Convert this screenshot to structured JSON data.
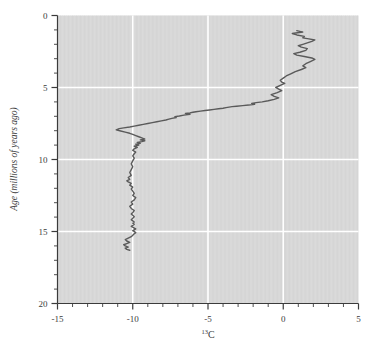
{
  "chart_data": {
    "type": "line",
    "title": "",
    "xlabel": "13C",
    "xlabel_sup": "13",
    "xlabel_base": "C",
    "ylabel": "Age (millions of years ago)",
    "xlim": [
      -15,
      5
    ],
    "ylim": [
      20,
      0
    ],
    "y_inverted": true,
    "grid": true,
    "grid_color": "#ffffff",
    "plot_bg": "#d8d8d8",
    "line_color": "#5a5a5a",
    "line_width": 1.4,
    "legend": null,
    "xticks": [
      -15,
      -10,
      -5,
      0,
      5
    ],
    "xticklabels": [
      "-15",
      "-10",
      "-5",
      "0",
      "5"
    ],
    "xminor_step": 1,
    "yticks": [
      0,
      5,
      10,
      15,
      20
    ],
    "yticklabels": [
      "0",
      "5",
      "10",
      "15",
      "20"
    ],
    "yminor_step": 1,
    "series": [
      {
        "name": "d13C record",
        "x": [
          0.9,
          1.3,
          0.6,
          0.9,
          1.4,
          1.3,
          1.7,
          2.1,
          1.9,
          1.6,
          1.3,
          1.0,
          1.2,
          1.6,
          1.5,
          1.1,
          0.7,
          0.9,
          1.4,
          1.9,
          2.1,
          1.8,
          1.5,
          1.3,
          1.5,
          1.2,
          0.8,
          0.5,
          0.2,
          0.0,
          -0.2,
          -0.1,
          0.1,
          -0.2,
          -0.5,
          -0.3,
          -0.1,
          -0.4,
          -0.8,
          -0.6,
          -0.3,
          -0.6,
          -1.0,
          -1.4,
          -1.8,
          -2.1,
          -1.9,
          -2.3,
          -2.7,
          -3.1,
          -3.4,
          -3.6,
          -3.8,
          -4.0,
          -4.3,
          -4.6,
          -4.9,
          -5.2,
          -5.5,
          -5.8,
          -6.0,
          -6.2,
          -6.5,
          -6.2,
          -6.6,
          -6.9,
          -7.2,
          -7.1,
          -7.4,
          -7.6,
          -7.8,
          -8.1,
          -8.4,
          -8.7,
          -9.0,
          -9.3,
          -9.6,
          -9.9,
          -10.2,
          -10.6,
          -10.9,
          -11.1,
          -10.8,
          -10.5,
          -10.2,
          -10.0,
          -9.8,
          -9.6,
          -9.4,
          -9.2,
          -9.5,
          -9.2,
          -9.4,
          -9.7,
          -9.5,
          -9.8,
          -9.6,
          -9.9,
          -9.7,
          -9.9,
          -10.0,
          -9.8,
          -9.9,
          -10.0,
          -9.9,
          -10.0,
          -10.1,
          -10.0,
          -10.1,
          -10.2,
          -10.1,
          -10.3,
          -10.2,
          -10.4,
          -10.3,
          -10.1,
          -10.2,
          -10.0,
          -10.1,
          -10.0,
          -9.9,
          -10.0,
          -9.8,
          -9.9,
          -10.1,
          -10.0,
          -10.2,
          -10.1,
          -9.9,
          -10.0,
          -10.1,
          -10.0,
          -9.9,
          -10.0,
          -10.1,
          -10.0,
          -9.9,
          -10.0,
          -9.9,
          -10.0,
          -10.1,
          -10.0,
          -9.9,
          -9.8,
          -9.9,
          -10.0,
          -9.9,
          -9.8,
          -9.9,
          -10.0,
          -10.1,
          -10.3,
          -10.5,
          -10.4,
          -10.2,
          -10.4,
          -10.6,
          -10.5,
          -10.3,
          -10.5,
          -10.4,
          -10.2
        ],
        "y": [
          1.05,
          1.15,
          1.25,
          1.35,
          1.45,
          1.55,
          1.62,
          1.7,
          1.8,
          1.9,
          2.0,
          2.1,
          2.2,
          2.3,
          2.42,
          2.55,
          2.65,
          2.75,
          2.85,
          2.95,
          3.05,
          3.2,
          3.35,
          3.5,
          3.62,
          3.75,
          3.9,
          4.05,
          4.2,
          4.35,
          4.5,
          4.62,
          4.72,
          4.85,
          5.0,
          5.12,
          5.22,
          5.35,
          5.5,
          5.62,
          5.72,
          5.82,
          5.92,
          6.0,
          6.05,
          6.1,
          6.16,
          6.22,
          6.26,
          6.3,
          6.33,
          6.36,
          6.4,
          6.44,
          6.48,
          6.52,
          6.56,
          6.6,
          6.64,
          6.68,
          6.72,
          6.76,
          6.8,
          6.86,
          6.92,
          6.98,
          7.02,
          7.08,
          7.14,
          7.2,
          7.26,
          7.32,
          7.38,
          7.44,
          7.5,
          7.56,
          7.62,
          7.68,
          7.74,
          7.8,
          7.86,
          7.94,
          8.02,
          8.1,
          8.18,
          8.26,
          8.34,
          8.42,
          8.5,
          8.58,
          8.64,
          8.7,
          8.76,
          8.82,
          8.88,
          8.94,
          9.0,
          9.08,
          9.16,
          9.26,
          9.36,
          9.48,
          9.6,
          9.75,
          9.9,
          10.1,
          10.3,
          10.5,
          10.7,
          10.9,
          11.1,
          11.25,
          11.38,
          11.48,
          11.56,
          11.66,
          11.78,
          11.92,
          12.05,
          12.2,
          12.35,
          12.5,
          12.65,
          12.8,
          12.95,
          13.1,
          13.25,
          13.4,
          13.55,
          13.68,
          13.78,
          13.88,
          13.98,
          14.08,
          14.18,
          14.26,
          14.34,
          14.42,
          14.5,
          14.58,
          14.64,
          14.7,
          14.76,
          14.82,
          14.88,
          14.94,
          15.0,
          15.08,
          15.16,
          15.26,
          15.36,
          15.46,
          15.56,
          15.66,
          15.76,
          15.84,
          15.92,
          16.0,
          16.08,
          16.16,
          16.24,
          16.3
        ]
      }
    ]
  },
  "axes": {
    "x_axis_name": "x-axis",
    "y_axis_name": "y-axis"
  }
}
